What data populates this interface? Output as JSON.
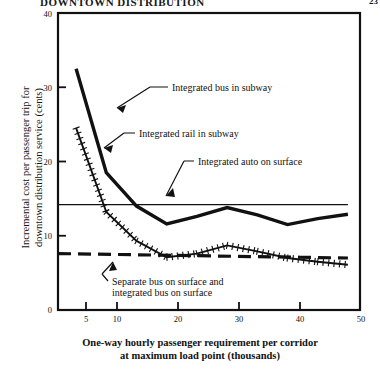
{
  "header": {
    "running_title": "DOWNTOWN DISTRIBUTION",
    "page_number": "23"
  },
  "chart_data": {
    "type": "line",
    "title": "",
    "xlabel": "One-way hourly passenger requirement per corridor\nat maximum load point (thousands)",
    "ylabel": "Incremental cost per passenger trip for\ndowntown distribution service (cents)",
    "xlim": [
      2,
      52
    ],
    "ylim": [
      0,
      40
    ],
    "xticks": [
      5,
      10,
      20,
      30,
      40,
      50
    ],
    "yticks": [
      0,
      10,
      20,
      30,
      40
    ],
    "grid": false,
    "legend": "annotations-with-leader-lines",
    "series": [
      {
        "name": "Integrated bus in subway",
        "style": "thick-solid",
        "x": [
          5,
          10,
          15,
          20,
          25,
          30,
          35,
          40,
          45,
          50
        ],
        "values": [
          32.5,
          18.5,
          14.0,
          11.6,
          12.6,
          13.8,
          12.8,
          11.5,
          12.3,
          12.9
        ]
      },
      {
        "name": "Integrated rail in subway",
        "style": "hatched-solid",
        "x": [
          5,
          10,
          15,
          20,
          25,
          30,
          35,
          40,
          45,
          50
        ],
        "values": [
          24.5,
          13.2,
          9.3,
          7.1,
          7.6,
          8.7,
          7.9,
          7.0,
          6.5,
          6.1
        ]
      },
      {
        "name": "Integrated auto on surface",
        "style": "thin-solid",
        "x": [
          2,
          50
        ],
        "values": [
          14.2,
          14.2
        ]
      },
      {
        "name": "Separate bus on surface and\nintegrated bus on surface",
        "style": "dashed",
        "x": [
          2,
          50
        ],
        "values": [
          7.6,
          7.0
        ]
      }
    ],
    "annotations": [
      {
        "id": "ann-bus-subway",
        "text": "Integrated bus in subway",
        "x_px": 172,
        "y_px": 88
      },
      {
        "id": "ann-rail-subway",
        "text": "Integrated rail in subway",
        "x_px": 139,
        "y_px": 134
      },
      {
        "id": "ann-auto-surface",
        "text": "Integrated auto on surface",
        "x_px": 198,
        "y_px": 162
      },
      {
        "id": "ann-sep-bus",
        "text": "Separate bus on surface and\nintegrated bus on surface",
        "x_px": 112,
        "y_px": 277
      }
    ]
  },
  "axis": {
    "y_ticks": [
      "0",
      "10",
      "20",
      "30",
      "40"
    ],
    "x_ticks": [
      "5",
      "10",
      "20",
      "30",
      "40",
      "50"
    ]
  },
  "annotations": {
    "bus_subway": "Integrated bus in subway",
    "rail_subway": "Integrated rail in subway",
    "auto_surface": "Integrated auto on surface",
    "sep_bus_line1": "Separate bus on surface and",
    "sep_bus_line2": "integrated bus on surface"
  },
  "colors": {
    "ink": "#111111",
    "paper": "#ffffff"
  }
}
